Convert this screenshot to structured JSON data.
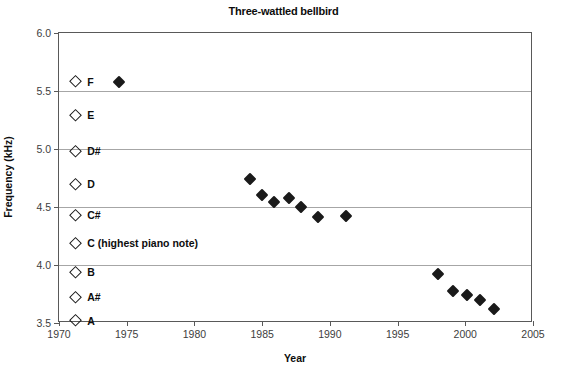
{
  "chart_data": {
    "type": "scatter",
    "title": "Three-wattled bellbird",
    "xlabel": "Year",
    "ylabel": "Frequency (kHz)",
    "xlim": [
      1970,
      2005
    ],
    "ylim": [
      3.5,
      6.0
    ],
    "xticks": [
      1970,
      1975,
      1980,
      1985,
      1990,
      1995,
      2000,
      2005
    ],
    "yticks": [
      "3.5",
      "4.0",
      "4.5",
      "5.0",
      "5.5",
      "6.0"
    ],
    "grid": "horizontal",
    "legend": "none",
    "series": [
      {
        "name": "Bellbird song frequency",
        "marker": "filled-diamond",
        "color": "#1a1a1a",
        "points": [
          {
            "x": 1974.4,
            "y": 5.58
          },
          {
            "x": 1984.1,
            "y": 4.74
          },
          {
            "x": 1985.0,
            "y": 4.6
          },
          {
            "x": 1985.9,
            "y": 4.54
          },
          {
            "x": 1987.0,
            "y": 4.58
          },
          {
            "x": 1987.9,
            "y": 4.5
          },
          {
            "x": 1989.1,
            "y": 4.41
          },
          {
            "x": 1991.2,
            "y": 4.42
          },
          {
            "x": 1998.0,
            "y": 3.92
          },
          {
            "x": 1999.1,
            "y": 3.78
          },
          {
            "x": 2000.1,
            "y": 3.74
          },
          {
            "x": 2001.1,
            "y": 3.7
          },
          {
            "x": 2002.1,
            "y": 3.62
          }
        ]
      }
    ],
    "annotations": {
      "description": "Musical note reference markers plotted as open diamonds near the left axis",
      "marker": "open-diamond",
      "x": 1971.2,
      "notes": [
        {
          "label": "F",
          "y": 5.58
        },
        {
          "label": "E",
          "y": 5.29
        },
        {
          "label": "D#",
          "y": 4.98
        },
        {
          "label": "D",
          "y": 4.7
        },
        {
          "label": "C#",
          "y": 4.43
        },
        {
          "label": "C (highest piano note)",
          "y": 4.19
        },
        {
          "label": "B",
          "y": 3.94
        },
        {
          "label": "A#",
          "y": 3.72
        },
        {
          "label": "A",
          "y": 3.52
        }
      ]
    }
  },
  "colors": {
    "marker": "#1a1a1a",
    "gridline": "#a6a6a6",
    "frame": "#595959",
    "background": "#ffffff",
    "text": "#0d0d0d",
    "tick_text": "#3d3d3d"
  }
}
